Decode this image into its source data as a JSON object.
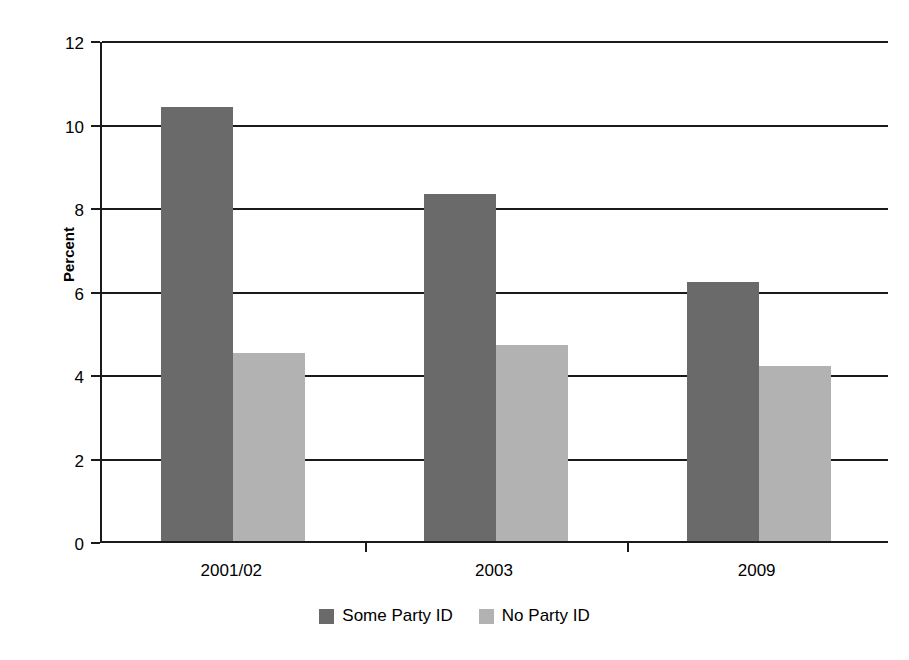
{
  "chart_data": {
    "type": "bar",
    "title": "",
    "xlabel": "",
    "ylabel": "Percent",
    "categories": [
      "2001/02",
      "2003",
      "2009"
    ],
    "series": [
      {
        "name": "Some Party ID",
        "color": "#6a6a6a",
        "values": [
          10.4,
          8.3,
          6.2
        ]
      },
      {
        "name": "No Party ID",
        "color": "#b2b2b2",
        "values": [
          4.5,
          4.7,
          4.2
        ]
      }
    ],
    "ylim": [
      0,
      12
    ],
    "ytick_values": [
      0,
      2,
      4,
      6,
      8,
      10,
      12
    ],
    "ytick_labels": [
      "0",
      "2",
      "4",
      "6",
      "8",
      "10",
      "12"
    ],
    "grid": true,
    "legend_position": "bottom"
  },
  "axis": {
    "y_title": "Percent"
  },
  "legend": {
    "items": [
      {
        "label": "Some Party ID",
        "color": "#6a6a6a"
      },
      {
        "label": "No Party ID",
        "color": "#b2b2b2"
      }
    ]
  },
  "colors": {
    "series_dark": "#6a6a6a",
    "series_light": "#b2b2b2",
    "axis": "#1a1a1a",
    "background": "#ffffff"
  }
}
